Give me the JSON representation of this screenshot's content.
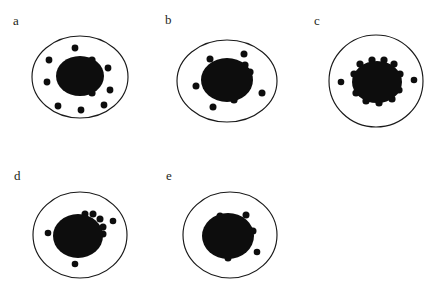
{
  "figure": {
    "background_color": "#ffffff",
    "ink_color": "#0d0d0d",
    "outline_color": "#1a1a1a",
    "label_color": "#231f20",
    "width": 442,
    "height": 300,
    "caption_partial": ""
  },
  "panels": [
    {
      "id": "a",
      "label": "a",
      "label_x": 13,
      "label_y": 25,
      "cell": {
        "cx": 80,
        "cy": 77,
        "rx": 48,
        "ry": 41
      },
      "nucleus": {
        "cx": 80,
        "cy": 76,
        "rx": 24,
        "ry": 20
      },
      "particles": [
        {
          "cx": 75,
          "cy": 48,
          "r": 3.4
        },
        {
          "cx": 49,
          "cy": 60,
          "r": 3.4
        },
        {
          "cx": 47,
          "cy": 82,
          "r": 3.4
        },
        {
          "cx": 58,
          "cy": 106,
          "r": 3.4
        },
        {
          "cx": 81,
          "cy": 110,
          "r": 3.4
        },
        {
          "cx": 104,
          "cy": 105,
          "r": 3.4
        },
        {
          "cx": 110,
          "cy": 90,
          "r": 3.4
        },
        {
          "cx": 108,
          "cy": 68,
          "r": 3.4
        },
        {
          "cx": 92,
          "cy": 60,
          "r": 3.6
        },
        {
          "cx": 92,
          "cy": 93,
          "r": 3.6
        }
      ]
    },
    {
      "id": "b",
      "label": "b",
      "label_x": 165,
      "label_y": 24,
      "cell": {
        "cx": 227,
        "cy": 81,
        "rx": 50,
        "ry": 41
      },
      "nucleus": {
        "cx": 227,
        "cy": 80,
        "rx": 26,
        "ry": 22
      },
      "particles": [
        {
          "cx": 210,
          "cy": 59,
          "r": 3.5
        },
        {
          "cx": 244,
          "cy": 54,
          "r": 3.5
        },
        {
          "cx": 196,
          "cy": 86,
          "r": 3.5
        },
        {
          "cx": 213,
          "cy": 107,
          "r": 3.5
        },
        {
          "cx": 262,
          "cy": 93,
          "r": 3.5
        },
        {
          "cx": 245,
          "cy": 65,
          "r": 3.6
        },
        {
          "cx": 250,
          "cy": 72,
          "r": 3.6
        },
        {
          "cx": 234,
          "cy": 100,
          "r": 3.6
        }
      ]
    },
    {
      "id": "c",
      "label": "c",
      "label_x": 314,
      "label_y": 25,
      "cell": {
        "cx": 376,
        "cy": 81,
        "rx": 47,
        "ry": 46
      },
      "nucleus": {
        "cx": 377,
        "cy": 82,
        "rx": 25,
        "ry": 21
      },
      "particles": [
        {
          "cx": 341,
          "cy": 82,
          "r": 3.3
        },
        {
          "cx": 414,
          "cy": 80,
          "r": 3.3
        },
        {
          "cx": 360,
          "cy": 64,
          "r": 3.6
        },
        {
          "cx": 372,
          "cy": 60,
          "r": 3.6
        },
        {
          "cx": 384,
          "cy": 60,
          "r": 3.6
        },
        {
          "cx": 394,
          "cy": 64,
          "r": 3.6
        },
        {
          "cx": 400,
          "cy": 74,
          "r": 3.6
        },
        {
          "cx": 399,
          "cy": 90,
          "r": 3.6
        },
        {
          "cx": 392,
          "cy": 99,
          "r": 3.6
        },
        {
          "cx": 379,
          "cy": 103,
          "r": 3.6
        },
        {
          "cx": 366,
          "cy": 101,
          "r": 3.6
        },
        {
          "cx": 356,
          "cy": 93,
          "r": 3.6
        },
        {
          "cx": 354,
          "cy": 74,
          "r": 3.6
        }
      ]
    },
    {
      "id": "d",
      "label": "d",
      "label_x": 14,
      "label_y": 180,
      "cell": {
        "cx": 80,
        "cy": 235,
        "rx": 47,
        "ry": 43
      },
      "nucleus": {
        "cx": 78,
        "cy": 236,
        "rx": 25,
        "ry": 22
      },
      "particles": [
        {
          "cx": 48,
          "cy": 233,
          "r": 3.3
        },
        {
          "cx": 75,
          "cy": 264,
          "r": 3.3
        },
        {
          "cx": 113,
          "cy": 221,
          "r": 3.3
        },
        {
          "cx": 85,
          "cy": 214,
          "r": 3.5
        },
        {
          "cx": 93,
          "cy": 214,
          "r": 3.5
        },
        {
          "cx": 100,
          "cy": 219,
          "r": 3.5
        },
        {
          "cx": 103,
          "cy": 227,
          "r": 3.5
        },
        {
          "cx": 103,
          "cy": 234,
          "r": 3.5
        }
      ]
    },
    {
      "id": "e",
      "label": "e",
      "label_x": 166,
      "label_y": 180,
      "cell": {
        "cx": 230,
        "cy": 235,
        "rx": 47,
        "ry": 43
      },
      "nucleus": {
        "cx": 228,
        "cy": 236,
        "rx": 26,
        "ry": 23
      },
      "particles": [
        {
          "cx": 220,
          "cy": 216,
          "r": 3.5
        },
        {
          "cx": 246,
          "cy": 215,
          "r": 3.5
        },
        {
          "cx": 253,
          "cy": 231,
          "r": 3.5
        },
        {
          "cx": 228,
          "cy": 258,
          "r": 3.5
        },
        {
          "cx": 257,
          "cy": 252,
          "r": 3.3
        }
      ]
    }
  ]
}
